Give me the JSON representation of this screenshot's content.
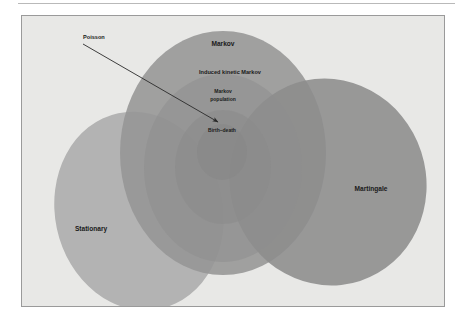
{
  "figure": {
    "kind": "euler-venn-diagram",
    "background_color": "#e8e8e6",
    "panel_border_color": "#9a9a9a",
    "page_background": "#ffffff",
    "top_rule_color": "#b9b9b9"
  },
  "sets": [
    {
      "id": "stationary",
      "label": "Stationary",
      "shape": "ellipse",
      "fill": "#a9a9a9",
      "opacity": 0.85,
      "cx": 117,
      "cy": 195,
      "rx": 84,
      "ry": 100,
      "rotation": -12,
      "label_x": 69,
      "label_y": 213,
      "label_size": "lbl-md"
    },
    {
      "id": "markov",
      "label": "Markov",
      "shape": "ellipse",
      "fill": "#959595",
      "opacity": 0.88,
      "cx": 201,
      "cy": 137,
      "rx": 103,
      "ry": 122,
      "rotation": 0,
      "label_x": 201,
      "label_y": 28,
      "label_size": "lbl-md"
    },
    {
      "id": "martingale",
      "label": "Martingale",
      "shape": "ellipse",
      "fill": "#8c8c8c",
      "opacity": 0.88,
      "cx": 306,
      "cy": 166,
      "rx": 98,
      "ry": 104,
      "rotation": -18,
      "label_x": 349,
      "label_y": 173,
      "label_size": "lbl-md"
    },
    {
      "id": "induced-kinetic-markov",
      "label": "Induced kinetic Markov",
      "shape": "ellipse",
      "fill": "#8e8e8e",
      "opacity": 0.55,
      "cx": 201,
      "cy": 152,
      "rx": 79,
      "ry": 94,
      "rotation": 0,
      "label_x": 208,
      "label_y": 57,
      "label_size": "lbl-sm"
    },
    {
      "id": "markov-population",
      "label": "Markov population",
      "label_line1": "Markov",
      "label_line2": "population",
      "shape": "ellipse",
      "fill": "#8a8a8a",
      "opacity": 0.55,
      "cx": 201,
      "cy": 151,
      "rx": 48,
      "ry": 57,
      "rotation": 0,
      "label_x": 201,
      "label_y": 76,
      "label_size": "lbl-xs"
    },
    {
      "id": "birth-death",
      "label": "Birth–death",
      "shape": "ellipse",
      "fill": "#878787",
      "opacity": 0.6,
      "cx": 200,
      "cy": 136,
      "rx": 25,
      "ry": 28,
      "rotation": 0,
      "label_x": 200,
      "label_y": 115,
      "label_size": "lbl-xs"
    }
  ],
  "annotation": {
    "label": "Poisson",
    "label_x": 61,
    "label_y": 22,
    "label_size": "lbl-sm",
    "arrow_color": "#2a2a2a",
    "arrow_start_x": 61,
    "arrow_start_y": 28,
    "arrow_end_x": 196,
    "arrow_end_y": 106
  },
  "colors": {
    "text": "#1a1a1a",
    "panel_fill": "#e8e8e6",
    "set_gray_light": "#a9a9a9",
    "set_gray_mid": "#959595",
    "set_gray_dark": "#8c8c8c"
  }
}
